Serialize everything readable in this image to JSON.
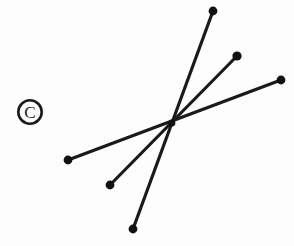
{
  "figure": {
    "title": "Three intersecting line segments with endpoint markers",
    "background_color": "#fdfdfd",
    "width": 294,
    "height": 246,
    "stroke_color": "#1a1a1a",
    "marker_color": "#111111",
    "intersection_label": "intersection-point",
    "intersection": {
      "x": 172,
      "y": 123
    }
  },
  "watermark": {
    "name": "copyright-symbol",
    "glyph": "©",
    "center_x": 30,
    "center_y": 112,
    "outer_radius": 13,
    "ring_width": 2.6,
    "color": "#1b1b1b"
  },
  "chart_data": {
    "type": "scatter",
    "title": "Three intersecting line segments with endpoint markers",
    "xlabel": "",
    "ylabel": "",
    "xlim": [
      0,
      294
    ],
    "ylim": [
      0,
      246
    ],
    "grid": false,
    "legend": "none",
    "series": [
      {
        "name": "line-steep",
        "stroke": "#1a1a1a",
        "stroke_width": 3.2,
        "x": [
          213,
          133
        ],
        "y": [
          11,
          229
        ],
        "endpoints": [
          {
            "label": "top-endpoint",
            "x": 213,
            "y": 11,
            "radius": 4.4
          },
          {
            "label": "bottom-endpoint",
            "x": 133,
            "y": 229,
            "radius": 4.4
          }
        ]
      },
      {
        "name": "line-diagonal",
        "stroke": "#1a1a1a",
        "stroke_width": 3.2,
        "x": [
          237,
          110
        ],
        "y": [
          56,
          185
        ],
        "endpoints": [
          {
            "label": "upper-right-endpoint",
            "x": 237,
            "y": 56,
            "radius": 4.6
          },
          {
            "label": "lower-left-endpoint",
            "x": 110,
            "y": 185,
            "radius": 4.4
          }
        ]
      },
      {
        "name": "line-shallow",
        "stroke": "#1a1a1a",
        "stroke_width": 3.2,
        "x": [
          281,
          68
        ],
        "y": [
          80,
          160
        ],
        "endpoints": [
          {
            "label": "right-endpoint",
            "x": 281,
            "y": 80,
            "radius": 4.4
          },
          {
            "label": "left-endpoint",
            "x": 68,
            "y": 160,
            "radius": 4.4
          }
        ]
      }
    ],
    "annotations": [
      {
        "label": "copyright-watermark",
        "text": "©",
        "x": 30,
        "y": 112
      }
    ]
  }
}
